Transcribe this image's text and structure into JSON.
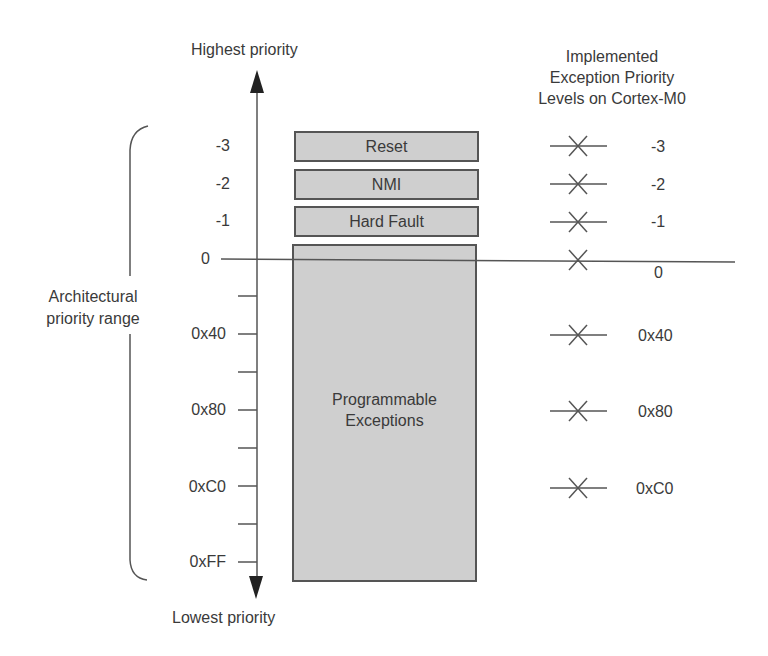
{
  "diagram": {
    "top_label": "Highest priority",
    "bottom_label": "Lowest priority",
    "bracket_label": [
      "Architectural",
      "priority range"
    ],
    "right_title": [
      "Implemented",
      "Exception Priority",
      "Levels on Cortex-M0"
    ],
    "axis_levels": [
      {
        "label": "-3",
        "y": 146
      },
      {
        "label": "-2",
        "y": 184
      },
      {
        "label": "-1",
        "y": 221
      },
      {
        "label": "0",
        "y": 259
      },
      {
        "label": "0x40",
        "y": 334
      },
      {
        "label": "0x80",
        "y": 410
      },
      {
        "label": "0xC0",
        "y": 486
      },
      {
        "label": "0xFF",
        "y": 562
      }
    ],
    "tick_y": [
      296,
      334,
      372,
      410,
      448,
      486,
      524,
      562
    ],
    "exceptions": [
      {
        "name": "Reset",
        "priority": "-3"
      },
      {
        "name": "NMI",
        "priority": "-2"
      },
      {
        "name": "Hard Fault",
        "priority": "-1"
      },
      {
        "name": "Programmable Exceptions",
        "priority_range": "0 to 0xFF",
        "lines": [
          "Programmable",
          "Exceptions"
        ]
      }
    ],
    "implemented_levels": [
      {
        "label": "-3",
        "y": 146
      },
      {
        "label": "-2",
        "y": 184
      },
      {
        "label": "-1",
        "y": 221
      },
      {
        "label": "0",
        "y": 259
      },
      {
        "label": "0x40",
        "y": 334
      },
      {
        "label": "0x80",
        "y": 410
      },
      {
        "label": "0xC0",
        "y": 486
      }
    ],
    "colors": {
      "line": "#555555",
      "box_fill": "#cfcfcf",
      "box_border": "#555555",
      "text": "#3a3a3a"
    }
  }
}
